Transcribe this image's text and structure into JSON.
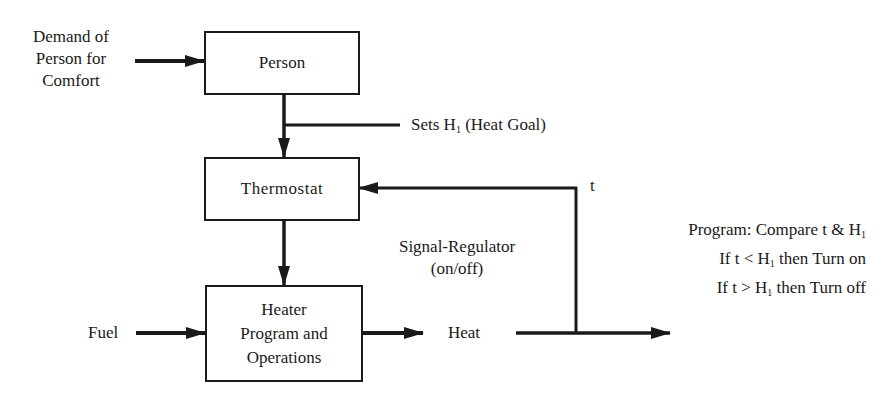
{
  "diagram": {
    "type": "block-diagram",
    "inputs": {
      "demand": [
        "Demand of",
        "Person for",
        "Comfort"
      ],
      "fuel": "Fuel"
    },
    "blocks": {
      "person": "Person",
      "thermostat": "Thermostat",
      "heater": [
        "Heater",
        "Program and",
        "Operations"
      ]
    },
    "labels": {
      "sets_prefix": "Sets H",
      "sets_sub": "1",
      "sets_suffix": " (Heat Goal)",
      "feedback_var": "t",
      "signal_regulator": [
        "Signal-Regulator",
        "(on/off)"
      ],
      "heat": "Heat"
    },
    "program": {
      "line1_prefix": "Program: Compare t & H",
      "line1_sub": "1",
      "line2_prefix": "If t < H",
      "line2_sub": "1",
      "line2_suffix": " then Turn on",
      "line3_prefix": "If t > H",
      "line3_sub": "1",
      "line3_suffix": " then Turn off"
    },
    "colors": {
      "ink": "#1a1a1a",
      "background": "#ffffff"
    }
  }
}
